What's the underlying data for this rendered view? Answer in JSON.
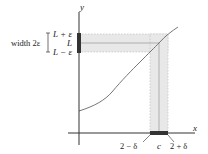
{
  "diagram": {
    "axes": {
      "x_label": "x",
      "y_label": "y"
    },
    "y_band": {
      "upper": "L + ε",
      "middle": "L",
      "lower": "L − ε",
      "width_label": "width 2ε"
    },
    "x_band": {
      "left": "2 − δ",
      "center": "c",
      "right": "2 + δ"
    },
    "colors": {
      "band_fill": "#e6e6e6",
      "axis": "#333333",
      "curve": "#555555",
      "interval_mark": "#222222"
    }
  }
}
